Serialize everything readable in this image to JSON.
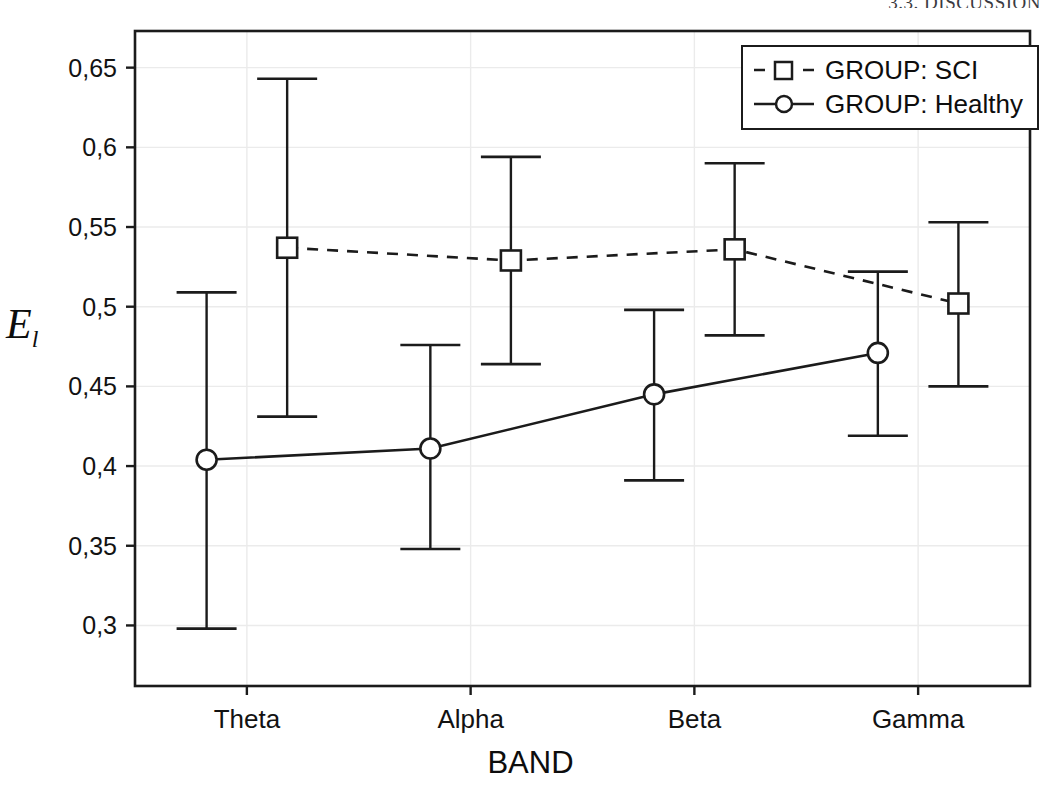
{
  "page": {
    "running_header": "3.3. DISCUSSION"
  },
  "legend": {
    "position": "top-right",
    "entries": [
      {
        "label": "GROUP: SCI",
        "marker": "square-marker-icon",
        "line": "dashed",
        "color": "#1b1b1b"
      },
      {
        "label": "GROUP: Healthy",
        "marker": "circle-marker-icon",
        "line": "solid",
        "color": "#1b1b1b"
      }
    ]
  },
  "chart_data": {
    "type": "line",
    "title": "",
    "xlabel": "BAND",
    "ylabel": "E_l",
    "ylabel_base": "E",
    "ylabel_sub": "l",
    "categories": [
      "Theta",
      "Alpha",
      "Beta",
      "Gamma"
    ],
    "ylim": [
      0.262,
      0.673
    ],
    "yticks": [
      0.3,
      0.35,
      0.4,
      0.45,
      0.5,
      0.55,
      0.6,
      0.65
    ],
    "ytick_labels": [
      "0,3",
      "0,35",
      "0,4",
      "0,45",
      "0,5",
      "0,55",
      "0,6",
      "0,65"
    ],
    "grid": true,
    "grid_color": "#ebebeb",
    "error_bar_style": "whisker-caps",
    "series": [
      {
        "name": "GROUP: SCI",
        "line": "dashed",
        "marker": "square",
        "color": "#1b1b1b",
        "x_offset": 0.045,
        "values": [
          0.537,
          0.529,
          0.536,
          0.502
        ],
        "err_low": [
          0.431,
          0.464,
          0.482,
          0.45
        ],
        "err_high": [
          0.643,
          0.594,
          0.59,
          0.553
        ]
      },
      {
        "name": "GROUP: Healthy",
        "line": "solid",
        "marker": "circle",
        "color": "#1b1b1b",
        "x_offset": -0.045,
        "values": [
          0.404,
          0.411,
          0.445,
          0.471
        ],
        "err_low": [
          0.298,
          0.348,
          0.391,
          0.419
        ],
        "err_high": [
          0.509,
          0.476,
          0.498,
          0.522
        ]
      }
    ]
  }
}
